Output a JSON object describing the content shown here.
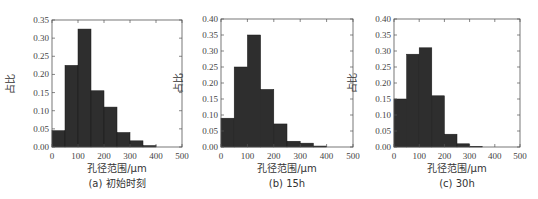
{
  "chart_data": [
    {
      "type": "bar",
      "title": "",
      "caption": "(a) 初始时刻",
      "xlabel": "孔径范围/μm",
      "ylabel": "占比",
      "bin_edges": [
        0,
        50,
        100,
        150,
        200,
        250,
        300,
        350,
        400
      ],
      "values": [
        0.045,
        0.225,
        0.325,
        0.155,
        0.11,
        0.04,
        0.017,
        0.004
      ],
      "xlim": [
        0,
        500
      ],
      "ylim": [
        0,
        0.35
      ],
      "xticks": [
        "0",
        "100",
        "200",
        "300",
        "400",
        "500"
      ],
      "xtick_values": [
        0,
        100,
        200,
        300,
        400,
        500
      ],
      "yticks": [
        "0.00",
        "0.05",
        "0.10",
        "0.15",
        "0.20",
        "0.25",
        "0.30",
        "0.35"
      ],
      "ytick_values": [
        0,
        0.05,
        0.1,
        0.15,
        0.2,
        0.25,
        0.3,
        0.35
      ],
      "bar_color": "#2e2e2e"
    },
    {
      "type": "bar",
      "title": "",
      "caption": "(b) 15h",
      "xlabel": "孔径范围/μm",
      "ylabel": "占比",
      "bin_edges": [
        0,
        50,
        100,
        150,
        200,
        250,
        300,
        350,
        400
      ],
      "values": [
        0.09,
        0.25,
        0.35,
        0.18,
        0.072,
        0.018,
        0.012,
        0.003
      ],
      "xlim": [
        0,
        500
      ],
      "ylim": [
        0,
        0.4
      ],
      "xticks": [
        "0",
        "100",
        "200",
        "300",
        "400",
        "500"
      ],
      "xtick_values": [
        0,
        100,
        200,
        300,
        400,
        500
      ],
      "yticks": [
        "0.00",
        "0.05",
        "0.10",
        "0.15",
        "0.20",
        "0.25",
        "0.30",
        "0.35",
        "0.40"
      ],
      "ytick_values": [
        0,
        0.05,
        0.1,
        0.15,
        0.2,
        0.25,
        0.3,
        0.35,
        0.4
      ],
      "bar_color": "#2e2e2e"
    },
    {
      "type": "bar",
      "title": "",
      "caption": "(c) 30h",
      "xlabel": "孔径范围/μm",
      "ylabel": "占比",
      "bin_edges": [
        0,
        50,
        100,
        150,
        200,
        250,
        300,
        350,
        400
      ],
      "values": [
        0.15,
        0.29,
        0.31,
        0.16,
        0.04,
        0.01,
        0.002,
        0.0
      ],
      "xlim": [
        0,
        500
      ],
      "ylim": [
        0,
        0.4
      ],
      "xticks": [
        "0",
        "100",
        "200",
        "300",
        "400",
        "500"
      ],
      "xtick_values": [
        0,
        100,
        200,
        300,
        400,
        500
      ],
      "yticks": [
        "0.00",
        "0.05",
        "0.10",
        "0.15",
        "0.20",
        "0.25",
        "0.30",
        "0.35",
        "0.40"
      ],
      "ytick_values": [
        0,
        0.05,
        0.1,
        0.15,
        0.2,
        0.25,
        0.3,
        0.35,
        0.4
      ],
      "bar_color": "#2e2e2e"
    }
  ]
}
